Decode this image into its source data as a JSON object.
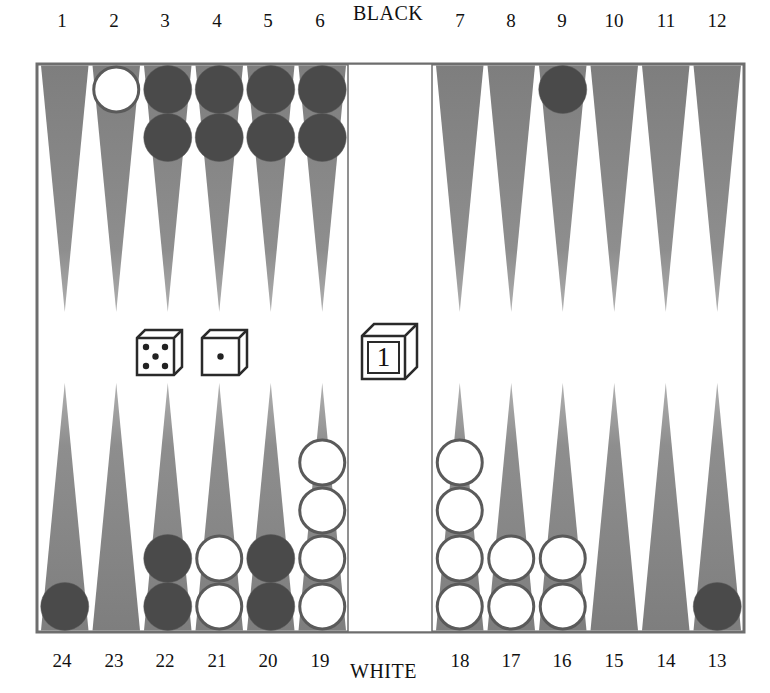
{
  "board": {
    "top_player_label": "BLACK",
    "bottom_player_label": "WHITE",
    "colors": {
      "point_fill": "#8a8a8a",
      "frame": "#6e6e6e",
      "background": "#ffffff",
      "black_checker": "#4a4a4a",
      "white_checker": "#ffffff",
      "checker_outline": "#5a5a5a"
    },
    "top_points": [
      {
        "number": "1",
        "checkers": 0,
        "color": ""
      },
      {
        "number": "2",
        "checkers": 1,
        "color": "white"
      },
      {
        "number": "3",
        "checkers": 2,
        "color": "black"
      },
      {
        "number": "4",
        "checkers": 2,
        "color": "black"
      },
      {
        "number": "5",
        "checkers": 2,
        "color": "black"
      },
      {
        "number": "6",
        "checkers": 2,
        "color": "black"
      },
      {
        "number": "7",
        "checkers": 0,
        "color": ""
      },
      {
        "number": "8",
        "checkers": 0,
        "color": ""
      },
      {
        "number": "9",
        "checkers": 1,
        "color": "black"
      },
      {
        "number": "10",
        "checkers": 0,
        "color": ""
      },
      {
        "number": "11",
        "checkers": 0,
        "color": ""
      },
      {
        "number": "12",
        "checkers": 0,
        "color": ""
      }
    ],
    "bottom_points": [
      {
        "number": "24",
        "checkers": 1,
        "color": "black"
      },
      {
        "number": "23",
        "checkers": 0,
        "color": ""
      },
      {
        "number": "22",
        "checkers": 2,
        "color": "black"
      },
      {
        "number": "21",
        "checkers": 2,
        "color": "white"
      },
      {
        "number": "20",
        "checkers": 2,
        "color": "black"
      },
      {
        "number": "19",
        "checkers": 4,
        "color": "white"
      },
      {
        "number": "18",
        "checkers": 4,
        "color": "white"
      },
      {
        "number": "17",
        "checkers": 2,
        "color": "white"
      },
      {
        "number": "16",
        "checkers": 2,
        "color": "white"
      },
      {
        "number": "15",
        "checkers": 0,
        "color": ""
      },
      {
        "number": "14",
        "checkers": 0,
        "color": ""
      },
      {
        "number": "13",
        "checkers": 1,
        "color": "black"
      }
    ],
    "dice": [
      {
        "name": "die-five",
        "value": 5
      },
      {
        "name": "die-one",
        "value": 1
      }
    ],
    "doubling_cube": {
      "value": "1"
    }
  }
}
